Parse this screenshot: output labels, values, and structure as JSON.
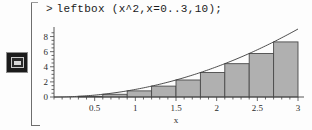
{
  "app": {
    "name": "Maple Worksheet",
    "gutter_icon": "worksheet-execution-icon",
    "bracket": "execution-group-bracket"
  },
  "input": {
    "prompt": ">",
    "command": "leftbox (x^2,x=0..3,10);"
  },
  "chart_data": {
    "type": "bar",
    "title": "",
    "subtitle": "",
    "xlabel": "x",
    "ylabel": "",
    "xlim": [
      0,
      3
    ],
    "ylim": [
      0,
      9
    ],
    "grid": false,
    "legend": null,
    "x_ticks": [
      0.5,
      1,
      1.5,
      2,
      2.5,
      3
    ],
    "x_tick_labels": [
      "0.5",
      "1",
      "1.5",
      "2",
      "2.5",
      "3"
    ],
    "y_ticks": [
      0,
      2,
      4,
      6,
      8
    ],
    "y_tick_labels": [
      "0",
      "2",
      "4",
      "6",
      "8"
    ],
    "minor_ticks": true,
    "bar_count": 10,
    "bar_width": 0.3,
    "bar_rule": "left-endpoint Riemann sum",
    "categories": [
      "0-0.3",
      "0.3-0.6",
      "0.6-0.9",
      "0.9-1.2",
      "1.2-1.5",
      "1.5-1.8",
      "1.8-2.1",
      "2.1-2.4",
      "2.4-2.7",
      "2.7-3.0"
    ],
    "bar_left_edges": [
      0,
      0.3,
      0.6,
      0.9,
      1.2,
      1.5,
      1.8,
      2.1,
      2.4,
      2.7
    ],
    "values": [
      0,
      0.09,
      0.36,
      0.81,
      1.44,
      2.25,
      3.24,
      4.41,
      5.76,
      7.29
    ],
    "series": [
      {
        "name": "leftbox rectangles",
        "values": [
          0,
          0.09,
          0.36,
          0.81,
          1.44,
          2.25,
          3.24,
          4.41,
          5.76,
          7.29
        ],
        "fill": "#b0b0b0",
        "stroke": "#4a4a4a"
      },
      {
        "name": "y = x^2",
        "type": "line",
        "stroke": "#3a3a3a",
        "x": [
          0,
          0.25,
          0.5,
          0.75,
          1,
          1.25,
          1.5,
          1.75,
          2,
          2.25,
          2.5,
          2.75,
          3
        ],
        "y": [
          0,
          0.0625,
          0.25,
          0.5625,
          1,
          1.5625,
          2.25,
          3.0625,
          4,
          5.0625,
          6.25,
          7.5625,
          9
        ]
      }
    ]
  },
  "colors": {
    "bar_fill": "#b0b0b0",
    "bar_stroke": "#4a4a4a",
    "curve": "#3a3a3a",
    "axis": "#444444",
    "text": "#1a1a1a",
    "background": "#fdfdfd"
  }
}
